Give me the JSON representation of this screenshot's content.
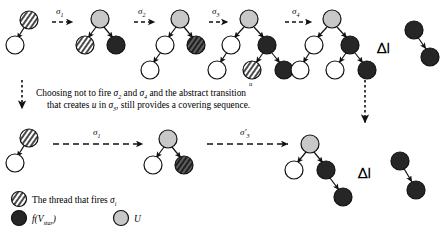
{
  "figure": {
    "caption_line1_parts": [
      {
        "t": "Choosing not to fire ",
        "i": false
      },
      {
        "t": "σ",
        "i": true
      },
      {
        "t": "2",
        "i": false,
        "sub": true
      },
      {
        "t": " and ",
        "i": false
      },
      {
        "t": "σ",
        "i": true
      },
      {
        "t": "4",
        "i": false,
        "sub": true
      },
      {
        "t": " and the abstract transition",
        "i": false
      }
    ],
    "caption_line1": "Choosing not to fire σ2 and σ4 and the abstract transition",
    "caption_line2": "that creates u in σ3, still provides a covering sequence.",
    "relation_symbol": "⊵",
    "u_node_label": "u",
    "top_row": {
      "arrow_labels": [
        "σ1",
        "σ2",
        "σ3",
        "σ4"
      ],
      "arrow_label_bases": [
        "σ",
        "σ",
        "σ",
        "σ"
      ],
      "arrow_label_subs": [
        "1",
        "2",
        "3",
        "4"
      ]
    },
    "bottom_row": {
      "arrow_labels": [
        "σ1",
        "σ'3"
      ],
      "arrow_label_bases": [
        "σ",
        "σ"
      ],
      "arrow_label_subs": [
        "1",
        "3"
      ],
      "arrow_label_primes": [
        "",
        "′"
      ]
    },
    "legend": {
      "items": [
        {
          "marker": "hatched",
          "text_plain": "The thread that fires σi",
          "text": "The thread that fires ",
          "sym": "σ",
          "sub": "i"
        },
        {
          "marker": "dark",
          "text_plain": "f(Vstar)",
          "text": "f(V",
          "sym": "star",
          "sub": "star"
        },
        {
          "marker": "gray",
          "text_plain": "U",
          "text": "U",
          "sym": "U",
          "sub": ""
        }
      ]
    },
    "colors": {
      "dark_node": "#262626",
      "gray_node": "#c8c8c8",
      "white_node": "#ffffff",
      "stroke": "#1a1a1a",
      "background": "#ffffff"
    },
    "node_kinds": {
      "hatched": "thread-that-fires",
      "dark": "f-of-V-star",
      "gray": "U",
      "white": "plain"
    }
  }
}
